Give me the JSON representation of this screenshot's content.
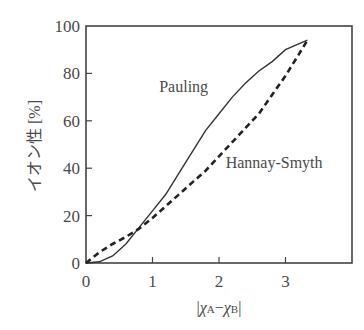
{
  "chart_data": {
    "type": "line",
    "title": "",
    "xlabel": "|χA − χB|",
    "xlabel_parts": {
      "bar_left": "|",
      "chi_a": "χ",
      "sub_a": "A",
      "minus": "−",
      "chi_b": "χ",
      "sub_b": "B",
      "bar_right": "|"
    },
    "ylabel": "イオン性 [%]",
    "xlim": [
      0,
      4
    ],
    "ylim": [
      0,
      100
    ],
    "xticks": [
      0,
      1,
      2,
      3
    ],
    "xtick_labels": [
      "0",
      "1",
      "2",
      "3"
    ],
    "yticks": [
      0,
      20,
      40,
      60,
      80,
      100
    ],
    "ytick_labels": [
      "0",
      "20",
      "40",
      "60",
      "80",
      "100"
    ],
    "grid": false,
    "legend": "inline labels",
    "series": [
      {
        "name": "Pauling",
        "style": "solid",
        "x": [
          0,
          0.2,
          0.4,
          0.6,
          0.8,
          1.0,
          1.2,
          1.4,
          1.6,
          1.8,
          2.0,
          2.2,
          2.4,
          2.6,
          2.8,
          3.0,
          3.33
        ],
        "values": [
          0,
          0.5,
          3,
          8,
          15,
          22,
          29,
          38,
          47,
          56,
          63,
          70,
          76,
          81,
          85,
          90,
          94
        ]
      },
      {
        "name": "Hannay-Smyth",
        "style": "dashed",
        "x": [
          0,
          0.2,
          0.4,
          0.6,
          0.8,
          1.0,
          1.2,
          1.4,
          1.6,
          1.8,
          2.0,
          2.2,
          2.4,
          2.6,
          2.8,
          3.0,
          3.2,
          3.33
        ],
        "values": [
          0,
          4.5,
          8,
          11,
          14.5,
          19,
          24,
          29,
          34,
          39,
          45,
          51,
          57,
          63,
          71,
          79,
          88,
          94
        ]
      }
    ],
    "annotations": [
      {
        "text": "Pauling",
        "x": 1.1,
        "y": 72
      },
      {
        "text": "Hannay-Smyth",
        "x": 2.1,
        "y": 40
      }
    ]
  }
}
